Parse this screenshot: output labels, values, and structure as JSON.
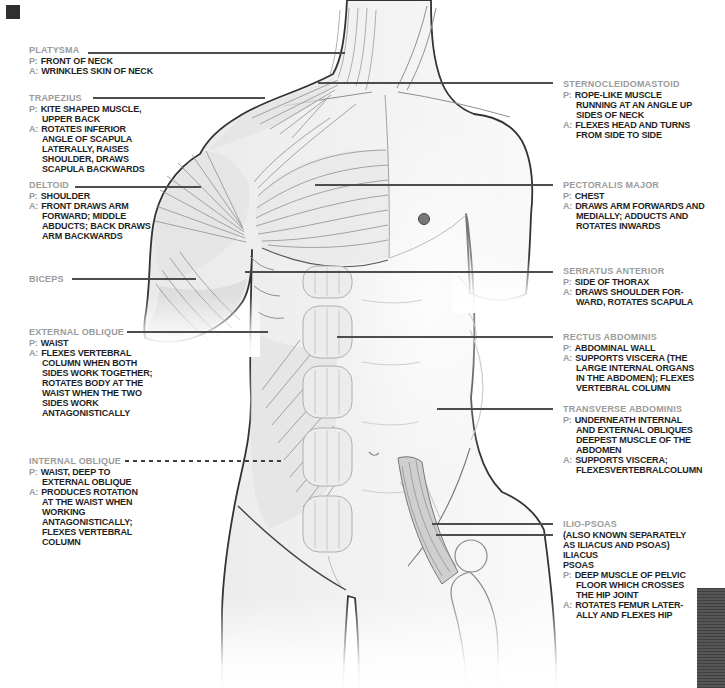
{
  "colors": {
    "heading_gray": "#9B9B9B",
    "body_text": "#1F1F1F",
    "leader_line": "#4D4D4D",
    "corner_square": "#2F2F2F",
    "side_bar": "#484848"
  },
  "labels": {
    "prefix_p": "P:",
    "prefix_a": "A:",
    "left": [
      {
        "name": "PLATYSMA",
        "p": "FRONT OF NECK",
        "a": "WRINKLES SKIN OF NECK"
      },
      {
        "name": "TRAPEZIUS",
        "p": "KITE SHAPED MUSCLE,\nUPPER BACK",
        "a": "ROTATES INFERIOR\nANGLE OF SCAPULA\nLATERALLY, RAISES\nSHOULDER, DRAWS\nSCAPULA BACKWARDS"
      },
      {
        "name": "DELTOID",
        "p": "SHOULDER",
        "a": "FRONT DRAWS ARM\nFORWARD; MIDDLE\nABDUCTS; BACK DRAWS\nARM BACKWARDS"
      },
      {
        "name": "BICEPS"
      },
      {
        "name": "EXTERNAL OBLIQUE",
        "p": "WAIST",
        "a": "FLEXES VERTEBRAL\nCOLUMN WHEN BOTH\nSIDES WORK TOGETHER;\nROTATES BODY AT THE\nWAIST WHEN THE TWO\nSIDES WORK\nANTAGONISTICALLY"
      },
      {
        "name": "INTERNAL OBLIQUE",
        "p": "WAIST, DEEP TO\nEXTERNAL OBLIQUE",
        "a": "PRODUCES ROTATION\nAT THE WAIST WHEN\nWORKING\nANTAGONISTICALLY;\nFLEXES VERTEBRAL\nCOLUMN"
      }
    ],
    "right": [
      {
        "name": "STERNOCLEIDOMASTOID",
        "p": "ROPE-LIKE MUSCLE\nRUNNING AT AN ANGLE UP\nSIDES OF NECK",
        "a": "FLEXES HEAD AND TURNS\nFROM SIDE TO SIDE"
      },
      {
        "name": "PECTORALIS MAJOR",
        "p": "CHEST",
        "a": "DRAWS ARM FORWARDS AND\nMEDIALLY; ADDUCTS AND\nROTATES INWARDS"
      },
      {
        "name": "SERRATUS ANTERIOR",
        "p": "SIDE OF THORAX",
        "a": "DRAWS SHOULDER FOR-\nWARD, ROTATES SCAPULA"
      },
      {
        "name": "RECTUS ABDOMINIS",
        "p": "ABDOMINAL WALL",
        "a": "SUPPORTS VISCERA (THE\nLARGE INTERNAL ORGANS\nIN THE ABDOMEN); FLEXES\nVERTEBRAL COLUMN"
      },
      {
        "name": "TRANSVERSE ABDOMINIS",
        "p": "UNDERNEATH INTERNAL\nAND EXTERNAL OBLIQUES\nDEEPEST MUSCLE OF THE\nABDOMEN",
        "a": "SUPPORTS VISCERA;\nFLEXESVERTEBRALCOLUMN"
      },
      {
        "name": "ILIO-PSOAS",
        "note": "(ALSO KNOWN SEPARATELY\nAS ILIACUS AND PSOAS)\nILIACUS\nPSOAS",
        "p": "DEEP MUSCLE OF PELVIC\nFLOOR WHICH CROSSES\nTHE HIP JOINT",
        "a": "ROTATES FEMUR LATER-\nALLY AND FLEXES HIP"
      }
    ]
  }
}
